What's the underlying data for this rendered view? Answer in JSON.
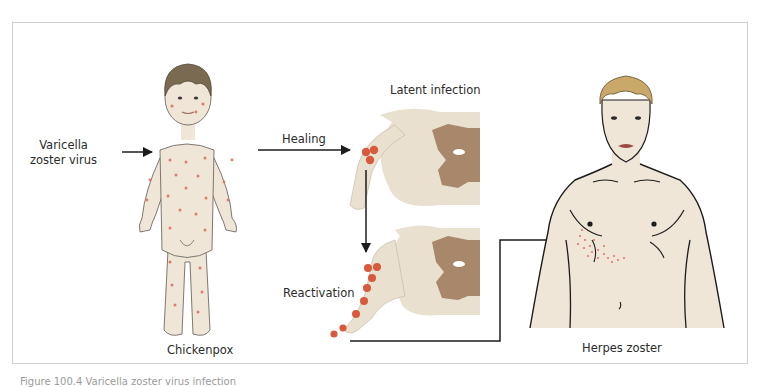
{
  "diagram": {
    "labels": {
      "virus": [
        "Varicella",
        "zoster virus"
      ],
      "healing": "Healing",
      "latent": "Latent infection",
      "reactivation": "Reactivation",
      "chickenpox": "Chickenpox",
      "herpes_zoster": "Herpes zoster"
    },
    "caption": "Figure 100.4  Varicella zoster virus infection",
    "colors": {
      "skin": "#efe6d8",
      "lesion": "#d9593c",
      "rash_dots": "#e07a6a",
      "grey_matter": "#a8876a",
      "spinal_cord": "#e9e0cf",
      "outline": "#1c1c1c",
      "frame": "#cfcfcf",
      "child_hair": "#7a6a52",
      "adult_hair": "#c9a86a"
    }
  }
}
